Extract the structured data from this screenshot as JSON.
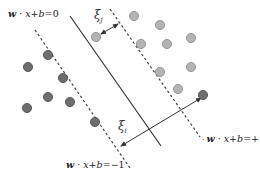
{
  "diagram": {
    "labels": {
      "hyperplane": {
        "w": "w",
        "mid": " · ",
        "x": "x",
        "rest": "+",
        "b": "b",
        "eq": "=0"
      },
      "margin_neg": {
        "w": "w",
        "mid": " · ",
        "x": "x",
        "rest": "+",
        "b": "b",
        "eq": "=−1"
      },
      "margin_pos": {
        "w": "w",
        "mid": " · ",
        "x": "x",
        "rest": "+",
        "b": "b",
        "eq": "=+1"
      },
      "slack_j": {
        "sym": "ξ",
        "sub": "j"
      },
      "slack_i": {
        "sym": "ξ",
        "sub": "i"
      }
    },
    "colors": {
      "dark_point": "#6e6e6e",
      "light_point": "#b4b4b4",
      "line": "#333333"
    },
    "points": {
      "class_neg": [
        [
          48,
          55
        ],
        [
          28,
          67
        ],
        [
          63,
          78
        ],
        [
          48,
          97
        ],
        [
          70,
          102
        ],
        [
          27,
          108
        ],
        [
          95,
          122
        ],
        [
          203,
          95
        ]
      ],
      "class_pos": [
        [
          96,
          37
        ],
        [
          134,
          16
        ],
        [
          160,
          25
        ],
        [
          141,
          44
        ],
        [
          167,
          44
        ],
        [
          191,
          38
        ],
        [
          160,
          72
        ],
        [
          191,
          67
        ],
        [
          178,
          89
        ]
      ]
    }
  }
}
